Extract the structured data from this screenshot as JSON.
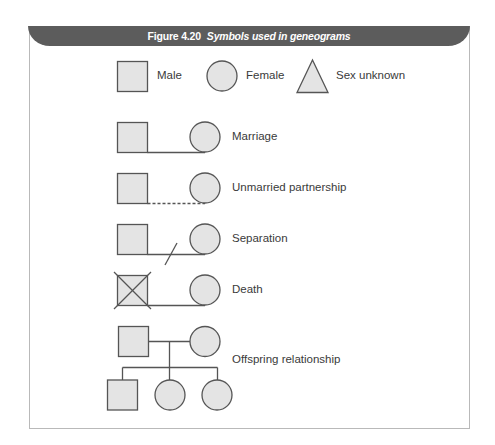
{
  "figure": {
    "number": "Figure 4.20",
    "caption": "Symbols used in geneograms",
    "header_color": "#5c5c5c"
  },
  "legend": [
    {
      "symbol": "square",
      "label": "Male"
    },
    {
      "symbol": "circle",
      "label": "Female"
    },
    {
      "symbol": "triangle",
      "label": "Sex unknown"
    }
  ],
  "relationships": [
    {
      "type": "marriage",
      "line": "solid",
      "label": "Marriage"
    },
    {
      "type": "unmarried",
      "line": "dashed",
      "label": "Unmarried partnership"
    },
    {
      "type": "separation",
      "line": "solid-with-slash",
      "label": "Separation"
    },
    {
      "type": "death",
      "line": "solid",
      "male_crossed": true,
      "label": "Death"
    },
    {
      "type": "offspring",
      "children": [
        "male",
        "female",
        "female"
      ],
      "label": "Offspring relationship"
    }
  ],
  "colors": {
    "symbol_fill": "#e4e4e4",
    "symbol_stroke": "#555555",
    "frame": "#b9b9b9"
  }
}
